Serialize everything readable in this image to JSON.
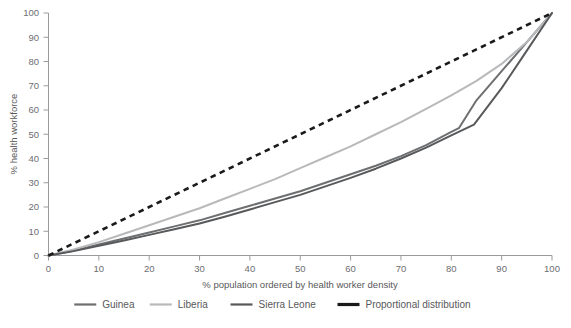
{
  "chart_data": {
    "type": "line",
    "title": "",
    "xlabel": "% population ordered by health worker density",
    "ylabel": "% health workforce",
    "xlim": [
      0,
      100
    ],
    "ylim": [
      0,
      100
    ],
    "xticks": [
      0,
      10,
      20,
      30,
      40,
      50,
      60,
      70,
      80,
      90,
      100
    ],
    "yticks": [
      0,
      10,
      20,
      30,
      40,
      50,
      60,
      70,
      80,
      90,
      100
    ],
    "grid": false,
    "legend_position": "bottom",
    "series": [
      {
        "name": "Guinea",
        "color": "#6e6f71",
        "style": "solid",
        "width": 2,
        "x": [
          0,
          5,
          10,
          15,
          20,
          25,
          30,
          35,
          40,
          45,
          50,
          55,
          60,
          65,
          70,
          75,
          80,
          81.5,
          85,
          90,
          95,
          100
        ],
        "y": [
          0,
          2,
          4.5,
          7,
          9.5,
          12,
          14.5,
          17.5,
          20.5,
          23.5,
          26.5,
          30,
          33.5,
          37,
          41,
          45.5,
          51,
          52.5,
          64,
          76,
          88,
          100
        ]
      },
      {
        "name": "Liberia",
        "color": "#b8b9bb",
        "style": "solid",
        "width": 2,
        "x": [
          0,
          5,
          10,
          15,
          20,
          25,
          30,
          35,
          40,
          45,
          50,
          55,
          60,
          65,
          70,
          75,
          80,
          85,
          90,
          95,
          100
        ],
        "y": [
          0,
          2.5,
          5.5,
          9,
          12.5,
          16,
          19.5,
          23.5,
          27.5,
          31.5,
          36,
          40.5,
          45,
          50,
          55,
          60.5,
          66,
          72,
          79,
          88,
          100
        ]
      },
      {
        "name": "Sierra Leone",
        "color": "#58595b",
        "style": "solid",
        "width": 2,
        "x": [
          0,
          5,
          10,
          15,
          20,
          25,
          30,
          35,
          40,
          45,
          50,
          55,
          60,
          65,
          70,
          75,
          80,
          84.5,
          90,
          95,
          100
        ],
        "y": [
          0,
          1.8,
          4,
          6.2,
          8.5,
          10.8,
          13.2,
          16,
          19,
          22,
          25,
          28.5,
          32,
          35.8,
          40,
          44.5,
          49.5,
          54,
          69,
          84.5,
          100
        ]
      },
      {
        "name": "Proportional distribution",
        "color": "#1a1a1a",
        "style": "dashed",
        "width": 2.6,
        "x": [
          0,
          100
        ],
        "y": [
          0,
          100
        ]
      }
    ]
  },
  "legend": {
    "items": [
      {
        "label": "Guinea",
        "color": "#6e6f71",
        "style": "solid"
      },
      {
        "label": "Liberia",
        "color": "#b8b9bb",
        "style": "solid"
      },
      {
        "label": "Sierra Leone",
        "color": "#58595b",
        "style": "solid"
      },
      {
        "label": "Proportional distribution",
        "color": "#1a1a1a",
        "style": "solid-thick"
      }
    ]
  },
  "axes": {
    "x_title": "% population ordered by health worker density",
    "y_title": "% health workforce",
    "x_tick_labels": [
      "0",
      "10",
      "20",
      "30",
      "40",
      "50",
      "60",
      "70",
      "80",
      "90",
      "100"
    ],
    "y_tick_labels": [
      "0",
      "10",
      "20",
      "30",
      "40",
      "50",
      "60",
      "70",
      "80",
      "90",
      "100"
    ]
  },
  "colors": {
    "axis": "#9a9b9d",
    "text": "#58585a",
    "background": "#ffffff"
  }
}
